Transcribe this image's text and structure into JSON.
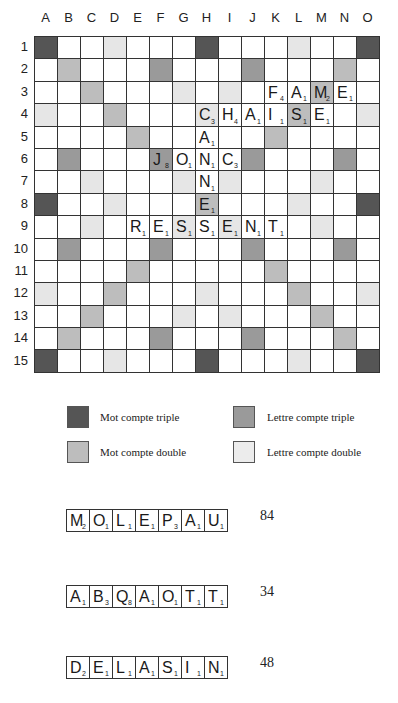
{
  "board": {
    "columns": [
      "A",
      "B",
      "C",
      "D",
      "E",
      "F",
      "G",
      "H",
      "I",
      "J",
      "K",
      "L",
      "M",
      "N",
      "O"
    ],
    "rows": [
      "1",
      "2",
      "3",
      "4",
      "5",
      "6",
      "7",
      "8",
      "9",
      "10",
      "11",
      "12",
      "13",
      "14",
      "15"
    ],
    "premiums": [
      "TW..DL...TW...DL...TW",
      "x"
    ],
    "premium_grid": [
      [
        "TW",
        "",
        "",
        "DL",
        "",
        "",
        "",
        "TW",
        "",
        "",
        "",
        "DL",
        "",
        "",
        "TW"
      ],
      [
        "",
        "DW",
        "",
        "",
        "",
        "TL",
        "",
        "",
        "",
        "TL",
        "",
        "",
        "",
        "DW",
        ""
      ],
      [
        "",
        "",
        "DW",
        "",
        "",
        "",
        "DL",
        "",
        "DL",
        "",
        "",
        "",
        "DW",
        "",
        ""
      ],
      [
        "DL",
        "",
        "",
        "DW",
        "",
        "",
        "",
        "DL",
        "",
        "",
        "",
        "DW",
        "",
        "",
        "DL"
      ],
      [
        "",
        "",
        "",
        "",
        "DW",
        "",
        "",
        "",
        "",
        "",
        "DW",
        "",
        "",
        "",
        ""
      ],
      [
        "",
        "TL",
        "",
        "",
        "",
        "TL",
        "",
        "",
        "",
        "TL",
        "",
        "",
        "",
        "TL",
        ""
      ],
      [
        "",
        "",
        "DL",
        "",
        "",
        "",
        "DL",
        "",
        "DL",
        "",
        "",
        "",
        "DL",
        "",
        ""
      ],
      [
        "TW",
        "",
        "",
        "DL",
        "",
        "",
        "",
        "DW",
        "",
        "",
        "",
        "DL",
        "",
        "",
        "TW"
      ],
      [
        "",
        "",
        "DL",
        "",
        "",
        "",
        "DL",
        "",
        "DL",
        "",
        "",
        "",
        "DL",
        "",
        ""
      ],
      [
        "",
        "TL",
        "",
        "",
        "",
        "TL",
        "",
        "",
        "",
        "TL",
        "",
        "",
        "",
        "TL",
        ""
      ],
      [
        "",
        "",
        "",
        "",
        "DW",
        "",
        "",
        "",
        "",
        "",
        "DW",
        "",
        "",
        "",
        ""
      ],
      [
        "DL",
        "",
        "",
        "DW",
        "",
        "",
        "",
        "DL",
        "",
        "",
        "",
        "DW",
        "",
        "",
        "DL"
      ],
      [
        "",
        "",
        "DW",
        "",
        "",
        "",
        "DL",
        "",
        "DL",
        "",
        "",
        "",
        "DW",
        "",
        ""
      ],
      [
        "",
        "DW",
        "",
        "",
        "",
        "TL",
        "",
        "",
        "",
        "TL",
        "",
        "",
        "",
        "DW",
        ""
      ],
      [
        "TW",
        "",
        "",
        "DL",
        "",
        "",
        "",
        "TW",
        "",
        "",
        "",
        "DL",
        "",
        "",
        "TW"
      ]
    ],
    "tiles": [
      {
        "row": 3,
        "col": "K",
        "letter": "F",
        "points": "4"
      },
      {
        "row": 3,
        "col": "L",
        "letter": "A",
        "points": "1"
      },
      {
        "row": 3,
        "col": "M",
        "letter": "M",
        "points": "2"
      },
      {
        "row": 3,
        "col": "N",
        "letter": "E",
        "points": "1"
      },
      {
        "row": 4,
        "col": "H",
        "letter": "C",
        "points": "3"
      },
      {
        "row": 4,
        "col": "I",
        "letter": "H",
        "points": "4"
      },
      {
        "row": 4,
        "col": "J",
        "letter": "A",
        "points": "1"
      },
      {
        "row": 4,
        "col": "K",
        "letter": "I",
        "points": "1"
      },
      {
        "row": 4,
        "col": "L",
        "letter": "S",
        "points": "1"
      },
      {
        "row": 4,
        "col": "M",
        "letter": "E",
        "points": "1"
      },
      {
        "row": 5,
        "col": "H",
        "letter": "A",
        "points": "1"
      },
      {
        "row": 6,
        "col": "F",
        "letter": "J",
        "points": "8"
      },
      {
        "row": 6,
        "col": "G",
        "letter": "O",
        "points": "1"
      },
      {
        "row": 6,
        "col": "H",
        "letter": "N",
        "points": "1"
      },
      {
        "row": 6,
        "col": "I",
        "letter": "C",
        "points": "3"
      },
      {
        "row": 7,
        "col": "H",
        "letter": "N",
        "points": "1"
      },
      {
        "row": 8,
        "col": "H",
        "letter": "E",
        "points": "1"
      },
      {
        "row": 9,
        "col": "E",
        "letter": "R",
        "points": "1"
      },
      {
        "row": 9,
        "col": "F",
        "letter": "E",
        "points": "1"
      },
      {
        "row": 9,
        "col": "G",
        "letter": "S",
        "points": "1"
      },
      {
        "row": 9,
        "col": "H",
        "letter": "S",
        "points": "1"
      },
      {
        "row": 9,
        "col": "I",
        "letter": "E",
        "points": "1"
      },
      {
        "row": 9,
        "col": "J",
        "letter": "N",
        "points": "1"
      },
      {
        "row": 9,
        "col": "K",
        "letter": "T",
        "points": "1"
      }
    ]
  },
  "legend": {
    "TW": {
      "label": "Mot compte triple",
      "color": "#555555"
    },
    "TL": {
      "label": "Lettre compte triple",
      "color": "#9a9a9a"
    },
    "DW": {
      "label": "Mot compte double",
      "color": "#bdbdbd"
    },
    "DL": {
      "label": "Lettre compte double",
      "color": "#ececec"
    }
  },
  "racks": [
    {
      "tiles": [
        [
          "M",
          "2"
        ],
        [
          "O",
          "1"
        ],
        [
          "L",
          "1"
        ],
        [
          "E",
          "1"
        ],
        [
          "P",
          "3"
        ],
        [
          "A",
          "1"
        ],
        [
          "U",
          "1"
        ]
      ],
      "score": "84"
    },
    {
      "tiles": [
        [
          "A",
          "1"
        ],
        [
          "B",
          "3"
        ],
        [
          "Q",
          "8"
        ],
        [
          "A",
          "1"
        ],
        [
          "O",
          "1"
        ],
        [
          "T",
          "1"
        ],
        [
          "T",
          "1"
        ]
      ],
      "score": "34"
    },
    {
      "tiles": [
        [
          "D",
          "2"
        ],
        [
          "E",
          "1"
        ],
        [
          "L",
          "1"
        ],
        [
          "A",
          "1"
        ],
        [
          "S",
          "1"
        ],
        [
          "I",
          "1"
        ],
        [
          "N",
          "1"
        ]
      ],
      "score": "48"
    }
  ]
}
